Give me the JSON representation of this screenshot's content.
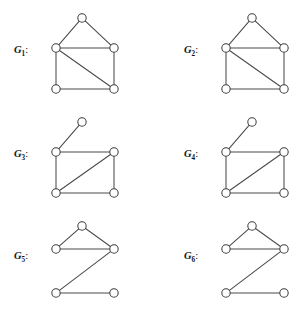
{
  "figure": {
    "width": 299,
    "height": 315,
    "background_color": "#ffffff",
    "edge_color": "#4a4a4a",
    "node_fill_color": "#ffffff",
    "node_stroke_color": "#3d3d3d",
    "label_color": "#141414",
    "node_radius": 4.2
  },
  "graphs": [
    {
      "id": "G1",
      "label_letter": "G",
      "label_subscript": "1",
      "label_colon": ":",
      "label_x": 14,
      "label_y": 53,
      "shape_name": "house-with-diagonal",
      "nodes": [
        {
          "name": "apex",
          "x": 82,
          "y": 18
        },
        {
          "name": "left-mid",
          "x": 56,
          "y": 48
        },
        {
          "name": "right-mid",
          "x": 114,
          "y": 48
        },
        {
          "name": "bottom-left",
          "x": 56,
          "y": 89
        },
        {
          "name": "bottom-right",
          "x": 114,
          "y": 89
        }
      ],
      "edges": [
        {
          "from": "apex",
          "to": "left-mid"
        },
        {
          "from": "apex",
          "to": "right-mid"
        },
        {
          "from": "left-mid",
          "to": "right-mid"
        },
        {
          "from": "left-mid",
          "to": "bottom-left"
        },
        {
          "from": "left-mid",
          "to": "bottom-right"
        },
        {
          "from": "right-mid",
          "to": "bottom-right"
        },
        {
          "from": "bottom-left",
          "to": "bottom-right"
        }
      ]
    },
    {
      "id": "G2",
      "label_letter": "G",
      "label_subscript": "2",
      "label_colon": ":",
      "label_x": 184,
      "label_y": 53,
      "shape_name": "house-with-diagonal",
      "nodes": [
        {
          "name": "apex",
          "x": 252,
          "y": 18
        },
        {
          "name": "left-mid",
          "x": 226,
          "y": 48
        },
        {
          "name": "right-mid",
          "x": 284,
          "y": 48
        },
        {
          "name": "bottom-left",
          "x": 226,
          "y": 89
        },
        {
          "name": "bottom-right",
          "x": 284,
          "y": 89
        }
      ],
      "edges": [
        {
          "from": "apex",
          "to": "left-mid"
        },
        {
          "from": "apex",
          "to": "right-mid"
        },
        {
          "from": "left-mid",
          "to": "right-mid"
        },
        {
          "from": "left-mid",
          "to": "bottom-left"
        },
        {
          "from": "left-mid",
          "to": "bottom-right"
        },
        {
          "from": "right-mid",
          "to": "bottom-right"
        },
        {
          "from": "bottom-left",
          "to": "bottom-right"
        }
      ]
    },
    {
      "id": "G3",
      "label_letter": "G",
      "label_subscript": "3",
      "label_colon": ":",
      "label_x": 14,
      "label_y": 157,
      "shape_name": "square-with-diagonal-and-pendant",
      "nodes": [
        {
          "name": "pendant",
          "x": 82,
          "y": 122
        },
        {
          "name": "left-mid",
          "x": 56,
          "y": 152
        },
        {
          "name": "right-mid",
          "x": 114,
          "y": 152
        },
        {
          "name": "bottom-left",
          "x": 56,
          "y": 193
        },
        {
          "name": "bottom-right",
          "x": 114,
          "y": 193
        }
      ],
      "edges": [
        {
          "from": "pendant",
          "to": "left-mid"
        },
        {
          "from": "left-mid",
          "to": "right-mid"
        },
        {
          "from": "left-mid",
          "to": "bottom-left"
        },
        {
          "from": "right-mid",
          "to": "bottom-right"
        },
        {
          "from": "bottom-left",
          "to": "right-mid"
        },
        {
          "from": "bottom-left",
          "to": "bottom-right"
        }
      ]
    },
    {
      "id": "G4",
      "label_letter": "G",
      "label_subscript": "4",
      "label_colon": ":",
      "label_x": 184,
      "label_y": 157,
      "shape_name": "square-with-diagonal-and-pendant",
      "nodes": [
        {
          "name": "pendant",
          "x": 252,
          "y": 122
        },
        {
          "name": "left-mid",
          "x": 226,
          "y": 152
        },
        {
          "name": "right-mid",
          "x": 284,
          "y": 152
        },
        {
          "name": "bottom-left",
          "x": 226,
          "y": 193
        },
        {
          "name": "bottom-right",
          "x": 284,
          "y": 193
        }
      ],
      "edges": [
        {
          "from": "pendant",
          "to": "left-mid"
        },
        {
          "from": "left-mid",
          "to": "right-mid"
        },
        {
          "from": "left-mid",
          "to": "bottom-left"
        },
        {
          "from": "right-mid",
          "to": "bottom-right"
        },
        {
          "from": "bottom-left",
          "to": "right-mid"
        },
        {
          "from": "bottom-left",
          "to": "bottom-right"
        }
      ]
    },
    {
      "id": "G5",
      "label_letter": "G",
      "label_subscript": "5",
      "label_colon": ":",
      "label_x": 14,
      "label_y": 259,
      "shape_name": "triangle-with-zigzag-tail",
      "nodes": [
        {
          "name": "apex",
          "x": 82,
          "y": 226
        },
        {
          "name": "left-mid",
          "x": 56,
          "y": 249
        },
        {
          "name": "right-mid",
          "x": 114,
          "y": 249
        },
        {
          "name": "bottom-left",
          "x": 56,
          "y": 293
        },
        {
          "name": "bottom-right",
          "x": 114,
          "y": 293
        }
      ],
      "edges": [
        {
          "from": "apex",
          "to": "left-mid"
        },
        {
          "from": "apex",
          "to": "right-mid"
        },
        {
          "from": "left-mid",
          "to": "right-mid"
        },
        {
          "from": "right-mid",
          "to": "bottom-left"
        },
        {
          "from": "bottom-left",
          "to": "bottom-right"
        }
      ]
    },
    {
      "id": "G6",
      "label_letter": "G",
      "label_subscript": "6",
      "label_colon": ":",
      "label_x": 184,
      "label_y": 259,
      "shape_name": "triangle-with-zigzag-tail",
      "nodes": [
        {
          "name": "apex",
          "x": 252,
          "y": 226
        },
        {
          "name": "left-mid",
          "x": 226,
          "y": 249
        },
        {
          "name": "right-mid",
          "x": 284,
          "y": 249
        },
        {
          "name": "bottom-left",
          "x": 226,
          "y": 293
        },
        {
          "name": "bottom-right",
          "x": 284,
          "y": 293
        }
      ],
      "edges": [
        {
          "from": "apex",
          "to": "left-mid"
        },
        {
          "from": "apex",
          "to": "right-mid"
        },
        {
          "from": "left-mid",
          "to": "right-mid"
        },
        {
          "from": "right-mid",
          "to": "bottom-left"
        },
        {
          "from": "bottom-left",
          "to": "bottom-right"
        }
      ]
    }
  ]
}
